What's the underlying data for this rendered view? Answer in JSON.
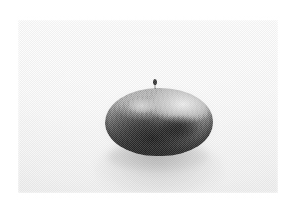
{
  "page": {
    "background_color": "#ffffff",
    "width": 296,
    "height": 207,
    "caption": ""
  },
  "photo": {
    "name": "halftone-photograph",
    "description": "Black and white halftone print of a dark oval shell-like object resting on a pale flat surface",
    "frame": {
      "left": 18,
      "top": 20,
      "width": 260,
      "height": 173
    },
    "background_tone": "#f2f2f2",
    "print_style": "halftone-dot-screen",
    "alt_text": ""
  },
  "subject": {
    "name": "dark-oval-object",
    "label": "",
    "shape": "oval",
    "body_color": "#2a2a2a",
    "highlight_color": "#ebebeb",
    "bounds": {
      "left": 105,
      "top": 88,
      "width": 108,
      "height": 68
    },
    "features": [
      {
        "name": "shell-highlight",
        "label": ""
      },
      {
        "name": "shell-texture-ridges",
        "label": ""
      },
      {
        "name": "shell-seam-depression",
        "label": ""
      },
      {
        "name": "top-speck",
        "label": ""
      }
    ]
  },
  "shadow": {
    "name": "cast-shadow",
    "label": "",
    "color": "#505050"
  }
}
